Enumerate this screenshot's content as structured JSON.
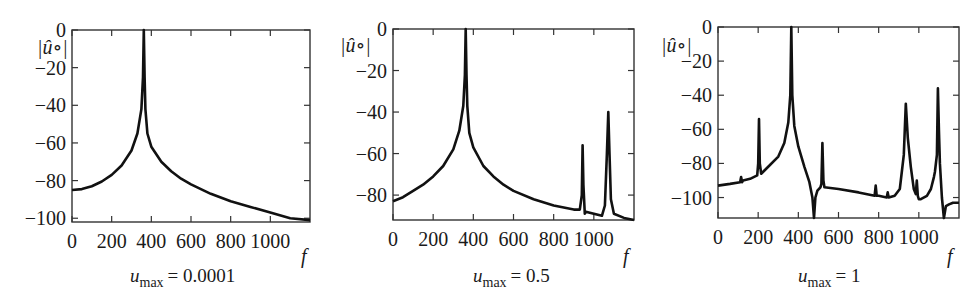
{
  "chart_data": [
    {
      "type": "line",
      "title": "",
      "caption": {
        "var": "u",
        "sub": "max",
        "value": "= 0.0001"
      },
      "xlabel": "f",
      "ylabel": "|û∘|",
      "xlim": [
        0,
        1200
      ],
      "ylim": [
        -102,
        0
      ],
      "xticks": [
        0,
        200,
        400,
        600,
        800,
        1000
      ],
      "yticks": [
        0,
        -20,
        -40,
        -60,
        -80,
        -100
      ],
      "grid": false,
      "series": [
        {
          "name": "spectrum",
          "x": [
            0,
            50,
            100,
            150,
            200,
            250,
            300,
            330,
            350,
            358,
            362,
            366,
            370,
            380,
            400,
            450,
            500,
            550,
            600,
            700,
            800,
            900,
            1000,
            1100,
            1200
          ],
          "y": [
            -85,
            -84.5,
            -83,
            -80.5,
            -77,
            -72,
            -64,
            -55,
            -42,
            -25,
            0,
            -25,
            -42,
            -55,
            -62,
            -70,
            -75,
            -79,
            -82,
            -87,
            -91,
            -94,
            -97,
            -100,
            -101
          ]
        }
      ],
      "box": {
        "x0": 72,
        "y0": 30,
        "x1": 310,
        "y1": 222
      }
    },
    {
      "type": "line",
      "title": "",
      "caption": {
        "var": "u",
        "sub": "max",
        "value": "= 0.5"
      },
      "xlabel": "f",
      "ylabel": "|û∘|",
      "xlim": [
        0,
        1200
      ],
      "ylim": [
        -92,
        0
      ],
      "xticks": [
        0,
        200,
        400,
        600,
        800,
        1000
      ],
      "yticks": [
        0,
        -20,
        -40,
        -60,
        -80
      ],
      "grid": false,
      "series": [
        {
          "name": "spectrum",
          "x": [
            0,
            50,
            100,
            150,
            200,
            250,
            300,
            330,
            350,
            358,
            362,
            366,
            370,
            380,
            400,
            450,
            500,
            550,
            600,
            700,
            800,
            900,
            930,
            940,
            944,
            948,
            955,
            960,
            1000,
            1040,
            1055,
            1065,
            1072,
            1078,
            1085,
            1100,
            1150,
            1200
          ],
          "y": [
            -83,
            -81,
            -78,
            -75,
            -71,
            -66,
            -58,
            -49,
            -37,
            -22,
            0,
            -22,
            -37,
            -50,
            -57,
            -66,
            -71,
            -75,
            -78,
            -82,
            -85,
            -87,
            -87,
            -80,
            -56,
            -75,
            -89,
            -88,
            -89,
            -90,
            -85,
            -60,
            -40,
            -60,
            -82,
            -89,
            -91,
            -92
          ]
        }
      ],
      "box": {
        "x0": 393,
        "y0": 29,
        "x1": 634,
        "y1": 220
      }
    },
    {
      "type": "line",
      "title": "",
      "caption": {
        "var": "u",
        "sub": "max",
        "value": "= 1"
      },
      "xlabel": "f",
      "ylabel": "|û∘|",
      "xlim": [
        0,
        1200
      ],
      "ylim": [
        -112,
        0
      ],
      "xticks": [
        0,
        200,
        400,
        600,
        800,
        1000
      ],
      "yticks": [
        0,
        -20,
        -40,
        -60,
        -80,
        -100
      ],
      "grid": false,
      "series": [
        {
          "name": "spectrum",
          "x": [
            0,
            60,
            110,
            115,
            120,
            125,
            160,
            195,
            200,
            204,
            208,
            215,
            250,
            300,
            330,
            350,
            360,
            365,
            370,
            380,
            400,
            430,
            455,
            470,
            478,
            485,
            495,
            510,
            515,
            520,
            525,
            530,
            600,
            700,
            780,
            785,
            790,
            800,
            840,
            845,
            850,
            880,
            905,
            915,
            925,
            930,
            935,
            945,
            960,
            975,
            985,
            990,
            995,
            1000,
            1010,
            1040,
            1060,
            1075,
            1080,
            1090,
            1095,
            1100,
            1105,
            1115,
            1125,
            1135,
            1150,
            1170,
            1200
          ],
          "y": [
            -93,
            -92,
            -91,
            -88,
            -91,
            -90,
            -89,
            -87,
            -80,
            -54,
            -80,
            -86,
            -82,
            -76,
            -68,
            -56,
            -40,
            0,
            -40,
            -58,
            -70,
            -82,
            -91,
            -100,
            -112,
            -100,
            -96,
            -94,
            -92,
            -68,
            -90,
            -94,
            -95,
            -97,
            -99,
            -93,
            -99,
            -99,
            -100,
            -97,
            -100,
            -99,
            -95,
            -85,
            -75,
            -60,
            -45,
            -65,
            -82,
            -95,
            -98,
            -90,
            -99,
            -101,
            -101,
            -99,
            -95,
            -88,
            -85,
            -75,
            -36,
            -60,
            -80,
            -100,
            -112,
            -105,
            -104,
            -103,
            -103
          ]
        }
      ],
      "box": {
        "x0": 718,
        "y0": 27,
        "x1": 959,
        "y1": 218
      }
    }
  ]
}
